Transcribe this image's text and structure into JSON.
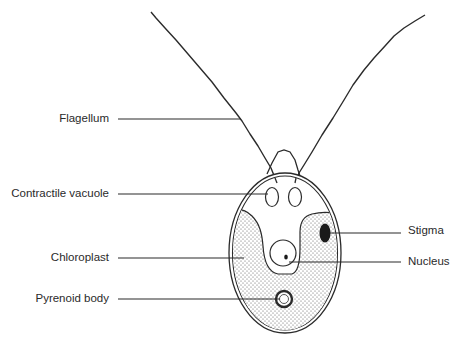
{
  "diagram": {
    "labels_left": [
      {
        "id": "flagellum",
        "text": "Flagellum"
      },
      {
        "id": "contractile-vacuole",
        "text": "Contractile vacuole"
      },
      {
        "id": "chloroplast",
        "text": "Chloroplast"
      },
      {
        "id": "pyrenoid-body",
        "text": "Pyrenoid body"
      }
    ],
    "labels_right": [
      {
        "id": "stigma",
        "text": "Stigma"
      },
      {
        "id": "nucleus",
        "text": "Nucleus"
      }
    ],
    "colors": {
      "line": "#2b2b2b",
      "background": "#ffffff",
      "stipple": "#555555",
      "stigma_fill": "#1a1a1a"
    }
  }
}
